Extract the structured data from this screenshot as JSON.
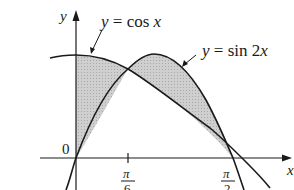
{
  "diagram": {
    "axes": {
      "x_label": "x",
      "y_label": "y",
      "origin_label": "0",
      "ticks": [
        {
          "label_num": "π",
          "label_den": "6",
          "value": "π/6"
        },
        {
          "label_num": "π",
          "label_den": "2",
          "value": "π/2"
        }
      ]
    },
    "curves": [
      {
        "name": "cos",
        "label": "y = cos x",
        "label_lhs": "y",
        "label_eq": " = cos ",
        "label_var": "x"
      },
      {
        "name": "sin2x",
        "label": "y = sin 2x",
        "label_lhs": "y",
        "label_eq": " = sin 2",
        "label_var": "x"
      }
    ],
    "shading": {
      "color": "#c8c8c8",
      "regions": [
        "0 ≤ x ≤ π/6 (cos x above sin 2x)",
        "π/6 ≤ x ≤ π/2 (sin 2x above cos x)"
      ]
    },
    "colors": {
      "stroke": "#1a1a1a",
      "fill": "#c8c8c8",
      "background": "#ffffff"
    }
  }
}
